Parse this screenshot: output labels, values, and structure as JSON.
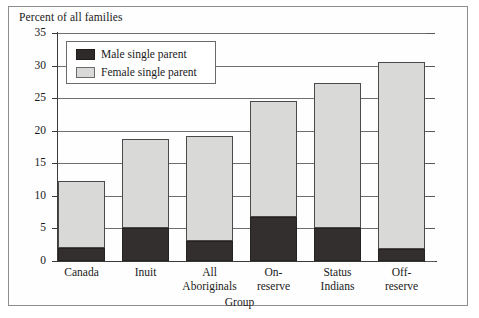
{
  "figure": {
    "title": "Percent of all families",
    "frame": {
      "visible": true
    }
  },
  "legend": {
    "position": "top-left-inside",
    "entries": [
      {
        "label": "Male single parent",
        "color": "#332f2f",
        "icon": "legend-swatch-male"
      },
      {
        "label": "Female single parent",
        "color": "#d9d9d7",
        "icon": "legend-swatch-female"
      }
    ]
  },
  "axes": {
    "x_title": "Group",
    "y_title": "Percent of all families",
    "y_ticks": [
      "0",
      "5",
      "10",
      "15",
      "20",
      "25",
      "30",
      "35"
    ],
    "x_tick_lines": [
      [
        "Canada",
        ""
      ],
      [
        "Inuit",
        ""
      ],
      [
        "All",
        "Aboriginals"
      ],
      [
        "On-",
        "reserve"
      ],
      [
        "Status",
        "Indians"
      ],
      [
        "Off-",
        "reserve"
      ]
    ]
  },
  "chart_data": {
    "type": "bar",
    "subtype": "stacked",
    "title": "Percent of all families",
    "xlabel": "Group",
    "ylabel": "Percent of all families",
    "ylim": [
      0,
      35
    ],
    "ytick_step": 5,
    "grid": true,
    "legend_position": "upper left",
    "categories": [
      "Canada",
      "Inuit",
      "All Aboriginals",
      "On-reserve",
      "Status Indians",
      "Off-reserve"
    ],
    "series": [
      {
        "name": "Male single parent",
        "color": "#332f2f",
        "values": [
          2.0,
          5.1,
          3.1,
          6.8,
          5.0,
          1.9
        ]
      },
      {
        "name": "Female single parent",
        "color": "#d9d9d7",
        "values": [
          10.3,
          13.6,
          16.1,
          17.7,
          22.4,
          28.6
        ]
      }
    ],
    "totals": [
      12.3,
      18.7,
      19.2,
      24.5,
      27.4,
      30.5
    ]
  }
}
